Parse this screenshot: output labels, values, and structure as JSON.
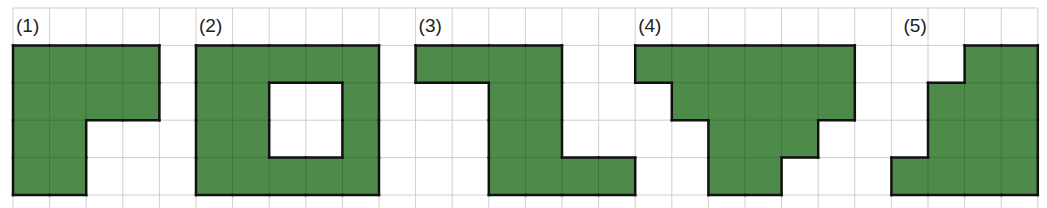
{
  "grid": {
    "origin_x": 13,
    "origin_y": 8,
    "cell_w": 36.6,
    "cell_h": 37.4,
    "cols": 28,
    "rows": 6,
    "line_color": "#cfcfcf",
    "fill_color": "#4e8b4b",
    "outline_color": "#111111"
  },
  "figures": [
    {
      "label": "(1)",
      "col": 0,
      "row": 1,
      "cells": [
        [
          0,
          0
        ],
        [
          1,
          0
        ],
        [
          2,
          0
        ],
        [
          3,
          0
        ],
        [
          0,
          1
        ],
        [
          1,
          1
        ],
        [
          2,
          1
        ],
        [
          3,
          1
        ],
        [
          0,
          2
        ],
        [
          1,
          2
        ],
        [
          0,
          3
        ],
        [
          1,
          3
        ]
      ]
    },
    {
      "label": "(2)",
      "col": 5,
      "row": 1,
      "cells": [
        [
          0,
          0
        ],
        [
          1,
          0
        ],
        [
          2,
          0
        ],
        [
          3,
          0
        ],
        [
          4,
          0
        ],
        [
          0,
          1
        ],
        [
          1,
          1
        ],
        [
          4,
          1
        ],
        [
          0,
          2
        ],
        [
          1,
          2
        ],
        [
          4,
          2
        ],
        [
          0,
          3
        ],
        [
          1,
          3
        ],
        [
          2,
          3
        ],
        [
          3,
          3
        ],
        [
          4,
          3
        ]
      ]
    },
    {
      "label": "(3)",
      "col": 11,
      "row": 1,
      "cells": [
        [
          0,
          0
        ],
        [
          1,
          0
        ],
        [
          2,
          0
        ],
        [
          3,
          0
        ],
        [
          2,
          1
        ],
        [
          3,
          1
        ],
        [
          2,
          2
        ],
        [
          3,
          2
        ],
        [
          2,
          3
        ],
        [
          3,
          3
        ],
        [
          4,
          3
        ],
        [
          5,
          3
        ]
      ]
    },
    {
      "label": "(4)",
      "col": 17,
      "row": 1,
      "cells": [
        [
          0,
          0
        ],
        [
          1,
          0
        ],
        [
          2,
          0
        ],
        [
          3,
          0
        ],
        [
          4,
          0
        ],
        [
          5,
          0
        ],
        [
          1,
          1
        ],
        [
          2,
          1
        ],
        [
          3,
          1
        ],
        [
          4,
          1
        ],
        [
          5,
          1
        ],
        [
          2,
          2
        ],
        [
          3,
          2
        ],
        [
          4,
          2
        ],
        [
          2,
          3
        ],
        [
          3,
          3
        ]
      ]
    },
    {
      "label": "(5)",
      "col": 24,
      "row": 1,
      "cells": [
        [
          2,
          0
        ],
        [
          3,
          0
        ],
        [
          1,
          1
        ],
        [
          2,
          1
        ],
        [
          3,
          1
        ],
        [
          1,
          2
        ],
        [
          2,
          2
        ],
        [
          3,
          2
        ],
        [
          0,
          3
        ],
        [
          1,
          3
        ],
        [
          2,
          3
        ],
        [
          3,
          3
        ]
      ]
    }
  ]
}
